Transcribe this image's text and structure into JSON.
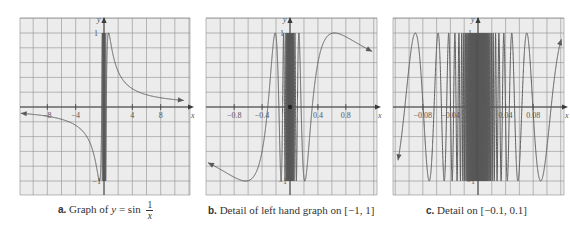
{
  "figure": {
    "panels": [
      {
        "id": "a",
        "caption_letter": "a.",
        "caption_text": "Graph of ",
        "caption_math_lhs": "y",
        "caption_math_eq": " = sin ",
        "caption_frac_num": "1",
        "caption_frac_den": "x",
        "x_axis_label": "x",
        "y_axis_label": "y",
        "y_tick_top": "1",
        "y_tick_bottom": "−1",
        "x_ticks": [
          "−8",
          "−4",
          "4",
          "8"
        ]
      },
      {
        "id": "b",
        "caption_letter": "b.",
        "caption_text": "Detail of left hand graph on [−1, 1]",
        "x_axis_label": "x",
        "y_axis_label": "y",
        "y_tick_top": "1",
        "y_tick_bottom": "−1",
        "x_ticks": [
          "−0.8",
          "−0.4",
          "0.4",
          "0.8"
        ]
      },
      {
        "id": "c",
        "caption_letter": "c.",
        "caption_text": "Detail on [−0.1, 0.1]",
        "x_axis_label": "x",
        "y_axis_label": "y",
        "y_tick_top": "1",
        "y_tick_bottom": "−1",
        "x_ticks": [
          "−0.08",
          "−0.04",
          "0.04",
          "0.08"
        ]
      }
    ],
    "colors": {
      "grid_background": "#ececec",
      "grid_line": "#8f8f8f",
      "axis": "#3c3c3c",
      "curve": "#5a5a5a"
    }
  },
  "chart_data": [
    {
      "type": "line",
      "title": "a. Graph of y = sin(1/x)",
      "function": "y = sin(1/x)",
      "xlabel": "x",
      "ylabel": "y",
      "xlim": [
        -12,
        12
      ],
      "ylim": [
        -1.2,
        1.2
      ],
      "x_ticks": [
        -8,
        -4,
        4,
        8
      ],
      "y_ticks": [
        -1,
        1
      ],
      "grid": true,
      "x_grid_step": 2,
      "y_grid_step": 0.2,
      "arrows": "both ends of curve, approaching y=0 as |x|→∞",
      "pixel_box": {
        "left": 20,
        "right": 190,
        "top": 18,
        "bottom": 195
      },
      "origin_px": [
        104,
        107
      ]
    },
    {
      "type": "line",
      "title": "b. Detail of left hand graph on [−1, 1]",
      "function": "y = sin(1/x)",
      "xlabel": "x",
      "ylabel": "y",
      "xlim": [
        -1.2,
        1.25
      ],
      "ylim": [
        -1.2,
        1.2
      ],
      "x_ticks": [
        -0.8,
        -0.4,
        0.4,
        0.8
      ],
      "y_ticks": [
        -1,
        1
      ],
      "grid": true,
      "x_grid_step": 0.2,
      "y_grid_step": 0.2,
      "pixel_box": {
        "left": 206,
        "right": 377,
        "top": 18,
        "bottom": 195
      },
      "origin_px": [
        290,
        107
      ]
    },
    {
      "type": "line",
      "title": "c. Detail on [−0.1, 0.1]",
      "function": "y = sin(1/x)",
      "xlabel": "x",
      "ylabel": "y",
      "xlim": [
        -0.123,
        0.125
      ],
      "ylim": [
        -1.2,
        1.2
      ],
      "x_ticks": [
        -0.08,
        -0.04,
        0.04,
        0.08
      ],
      "y_ticks": [
        -1,
        1
      ],
      "grid": true,
      "x_grid_step": 0.02,
      "y_grid_step": 0.2,
      "pixel_box": {
        "left": 393,
        "right": 564,
        "top": 18,
        "bottom": 195
      },
      "origin_px": [
        478,
        107
      ]
    }
  ]
}
